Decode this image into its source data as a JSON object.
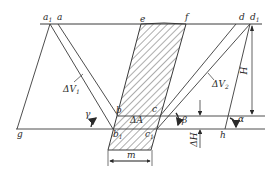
{
  "figure": {
    "type": "geological cross-section / mining diagram",
    "points": {
      "a1": {
        "label": "a",
        "sub": "1"
      },
      "a": {
        "label": "a",
        "sub": ""
      },
      "e": {
        "label": "e",
        "sub": ""
      },
      "f": {
        "label": "f",
        "sub": ""
      },
      "d": {
        "label": "d",
        "sub": ""
      },
      "d1": {
        "label": "d",
        "sub": "1"
      },
      "b": {
        "label": "b",
        "sub": ""
      },
      "b1": {
        "label": "b",
        "sub": "1"
      },
      "c": {
        "label": "c",
        "sub": ""
      },
      "c1": {
        "label": "c",
        "sub": "1"
      },
      "g": {
        "label": "g",
        "sub": ""
      },
      "h": {
        "label": "h",
        "sub": ""
      }
    },
    "annotations": {
      "dV1": {
        "label": "ΔV",
        "sub": "1"
      },
      "dV2": {
        "label": "ΔV",
        "sub": "2"
      },
      "dA": {
        "label": "ΔA",
        "sub": ""
      },
      "H": {
        "label": "H"
      },
      "dH": {
        "label": "ΔH"
      },
      "m": {
        "label": "m"
      },
      "gamma": {
        "label": "γ"
      },
      "beta": {
        "label": "β"
      },
      "alpha": {
        "label": "α"
      }
    },
    "colors": {
      "line": "#3a3a3a",
      "hatch": "#4a4a4a",
      "background": "#ffffff"
    }
  }
}
